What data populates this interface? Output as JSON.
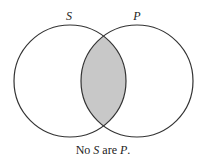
{
  "diagram": {
    "type": "venn",
    "sets": [
      {
        "label": "S",
        "cx": 70,
        "cy": 81,
        "r": 56
      },
      {
        "label": "P",
        "cx": 137,
        "cy": 81,
        "r": 56
      }
    ],
    "shaded_region": "intersection",
    "shade_color": "#c8c8c8",
    "stroke_color": "#333333",
    "caption": {
      "prefix": "No ",
      "subject": "S",
      "middle": " are ",
      "predicate": "P",
      "suffix": "."
    }
  }
}
